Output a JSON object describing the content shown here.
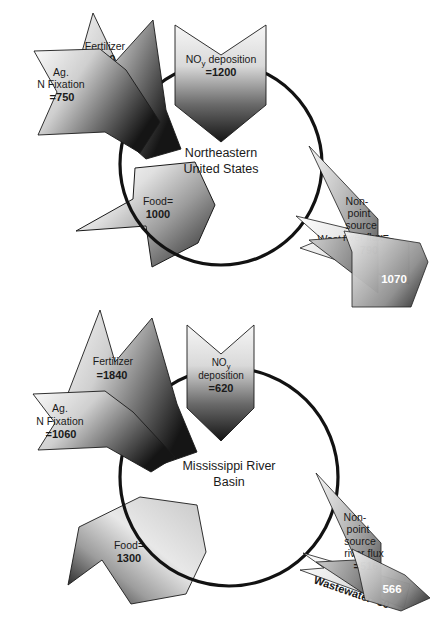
{
  "figure": {
    "type": "nitrogen-budget-flow-diagram",
    "units_note": "",
    "panels": [
      {
        "id": "northeastern-us",
        "center_label_lines": [
          "Northeastern",
          "United States"
        ],
        "inputs": [
          {
            "name": "fertilizer",
            "label_lines": [
              "Fertilizer",
              "=600"
            ],
            "value": 600
          },
          {
            "name": "ag-n-fixation",
            "label_lines": [
              "Ag.",
              "N Fixation",
              "=750"
            ],
            "value": 750
          },
          {
            "name": "noy-deposition",
            "label_lines": [
              "NO",
              "y",
              " deposition",
              "=1200"
            ],
            "value": 1200
          }
        ],
        "outputs": [
          {
            "name": "food",
            "label_lines": [
              "Food=",
              "1000"
            ],
            "value": 1000
          },
          {
            "name": "nonpoint-river-flux",
            "label_lines": [
              "Non-",
              "point",
              "source",
              "river flux=",
              "790"
            ],
            "value": 790
          },
          {
            "name": "wastewater",
            "label_lines": [
              "Wastewater",
              "=280"
            ],
            "value": 280
          }
        ],
        "total_badge": "1070"
      },
      {
        "id": "mississippi-river-basin",
        "center_label_lines": [
          "Mississippi River",
          "Basin"
        ],
        "inputs": [
          {
            "name": "fertilizer",
            "label_lines": [
              "Fertilizer",
              "=1840"
            ],
            "value": 1840
          },
          {
            "name": "ag-n-fixation",
            "label_lines": [
              "Ag.",
              "N Fixation",
              "=1060"
            ],
            "value": 1060
          },
          {
            "name": "noy-deposition",
            "label_lines": [
              "NO",
              "y",
              "deposition",
              "=620"
            ],
            "value": 620
          }
        ],
        "outputs": [
          {
            "name": "food",
            "label_lines": [
              "Food=",
              "1300"
            ],
            "value": 1300
          },
          {
            "name": "nonpoint-river-flux",
            "label_lines": [
              "Non-",
              "point",
              "source",
              "river flux",
              "=516"
            ],
            "value": 516
          },
          {
            "name": "wastewater",
            "label_lines": [
              "Wastewater=50"
            ],
            "value": 50
          }
        ],
        "total_badge": "566"
      }
    ]
  },
  "text": {
    "p1": {
      "center_1": "Northeastern",
      "center_2": "United States",
      "fertilizer_1": "Fertilizer",
      "fertilizer_2": "=600",
      "agfix_1": "Ag.",
      "agfix_2": "N Fixation",
      "agfix_3": "=750",
      "noy_main": "NO",
      "noy_sub": "y",
      "noy_rest": " deposition",
      "noy_val": "=1200",
      "food_1": "Food=",
      "food_2": "1000",
      "npsrf_1": "Non-",
      "npsrf_2": "point",
      "npsrf_3": "source",
      "npsrf_4": "river flux=",
      "npsrf_5": "790",
      "waste_1": "Wastewater",
      "waste_2": "=280",
      "badge": "1070"
    },
    "p2": {
      "center_1": "Mississippi River",
      "center_2": "Basin",
      "fertilizer_1": "Fertilizer",
      "fertilizer_2": "=1840",
      "agfix_1": "Ag.",
      "agfix_2": "N Fixation",
      "agfix_3": "=1060",
      "noy_main": "NO",
      "noy_sub": "y",
      "noy_rest": "deposition",
      "noy_val": "=620",
      "food_1": "Food=",
      "food_2": "1300",
      "npsrf_1": "Non-",
      "npsrf_2": "point",
      "npsrf_3": "source",
      "npsrf_4": "river flux",
      "npsrf_5": "=516",
      "waste_1": "Wastewater=50",
      "badge": "566"
    }
  },
  "colors": {
    "stroke": "#1a1a1a",
    "text": "#1a1a1a",
    "white_text": "#ffffff",
    "grad_light": "#f2f2f2",
    "grad_mid": "#9a9a9a",
    "grad_dark": "#1c1c1c",
    "background": "#ffffff"
  }
}
